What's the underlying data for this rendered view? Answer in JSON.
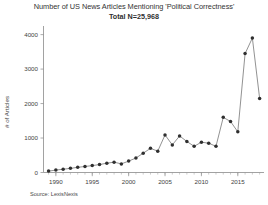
{
  "chart_data": {
    "type": "line",
    "title": "Number of US News Articles Mentioning 'Political Correctness'",
    "subtitle": "Total N=25,968",
    "xlabel": "",
    "ylabel": "# of Articles",
    "source": "Source: LexisNexis",
    "xlim": [
      1988.3,
      2018.6
    ],
    "ylim": [
      0,
      4250
    ],
    "grid": false,
    "legend": false,
    "marker": "filled-circle",
    "line_color": "#6e6e6e",
    "marker_color": "#2f2f2f",
    "yticks": [
      0,
      1000,
      2000,
      3000,
      4000
    ],
    "ytick_labels": [
      "0",
      "1000",
      "2000",
      "3000",
      "4000"
    ],
    "xticks": [
      1990,
      1995,
      2000,
      2005,
      2010,
      2015
    ],
    "xtick_labels": [
      "1990",
      "1995",
      "2000",
      "2005",
      "2010",
      "2015"
    ],
    "x": [
      1989,
      1990,
      1991,
      1992,
      1993,
      1994,
      1995,
      1996,
      1997,
      1998,
      1999,
      2000,
      2001,
      2002,
      2003,
      2004,
      2005,
      2006,
      2007,
      2008,
      2009,
      2010,
      2011,
      2012,
      2013,
      2014,
      2015,
      2016,
      2017,
      2018
    ],
    "values": [
      40,
      70,
      95,
      120,
      150,
      175,
      200,
      230,
      270,
      300,
      250,
      330,
      420,
      560,
      700,
      620,
      1090,
      800,
      1060,
      900,
      760,
      880,
      850,
      760,
      1600,
      1480,
      1180,
      3450,
      3900,
      2150
    ],
    "annotations": []
  },
  "figure": {
    "background": "#ffffff",
    "axis_color": "#8a8a8a",
    "text_color": "#3a3a3a"
  }
}
